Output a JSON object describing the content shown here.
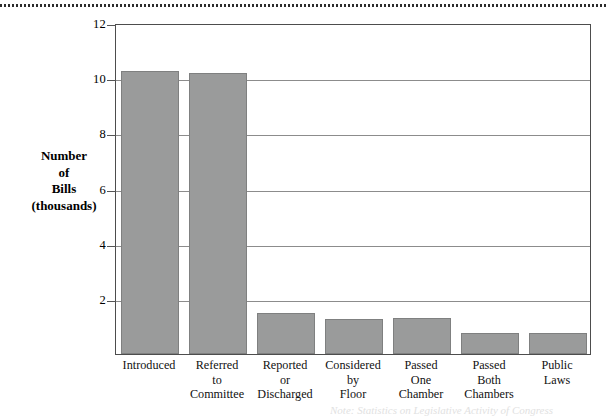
{
  "figure": {
    "top_rule": "dotted-rule",
    "caption_partial": "Note: Statistics on Legislative Activity of Congress"
  },
  "axis": {
    "y_title_lines": [
      "Number",
      "of",
      "Bills",
      "(thousands)"
    ],
    "y_ticks": [
      "12",
      "10",
      "8",
      "6",
      "4",
      "2"
    ]
  },
  "chart_data": {
    "type": "bar",
    "title": "",
    "xlabel": "",
    "ylabel": "Number of Bills (thousands)",
    "ylim": [
      0,
      12
    ],
    "yticks": [
      0,
      2,
      4,
      6,
      8,
      10,
      12
    ],
    "grid": true,
    "grid_axis": "y",
    "legend": "none",
    "bar_color": "#9a9b9b",
    "bar_edge_color": "#7f8080",
    "categories": [
      "Introduced",
      "Referred to Committee",
      "Reported or Discharged",
      "Considered by Floor",
      "Passed One Chamber",
      "Passed Both Chambers",
      "Public Laws"
    ],
    "category_label_lines": [
      [
        "Introduced"
      ],
      [
        "Referred",
        "to",
        "Committee"
      ],
      [
        "Reported",
        "or",
        "Discharged"
      ],
      [
        "Considered",
        "by",
        "Floor"
      ],
      [
        "Passed",
        "One",
        "Chamber"
      ],
      [
        "Passed",
        "Both",
        "Chambers"
      ],
      [
        "Public",
        "Laws"
      ]
    ],
    "values": [
      10.25,
      10.2,
      1.5,
      1.27,
      1.3,
      0.78,
      0.76
    ],
    "units": "thousands of bills"
  }
}
